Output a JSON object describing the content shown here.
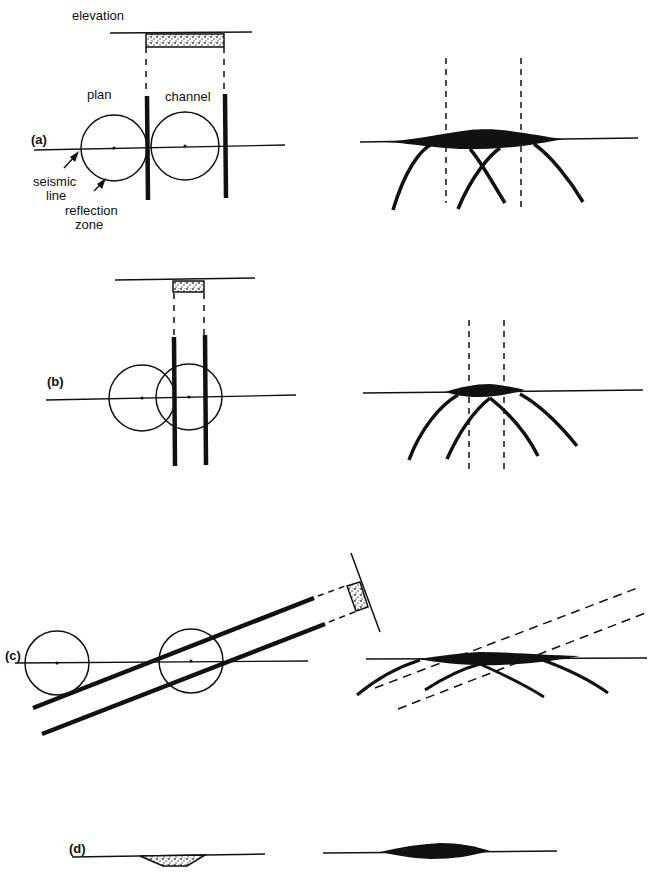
{
  "figure": {
    "panels": [
      {
        "id": "a",
        "label": "(a)"
      },
      {
        "id": "b",
        "label": "(b)"
      },
      {
        "id": "c",
        "label": "(c)"
      },
      {
        "id": "d",
        "label": "(d)"
      }
    ],
    "annotations": {
      "elevation": "elevation",
      "plan": "plan",
      "channel": "channel",
      "seismic_line_1": "seismic",
      "seismic_line_2": "line",
      "reflection_zone_1": "reflection",
      "reflection_zone_2": "zone"
    },
    "colors": {
      "ink": "#111111",
      "fill_pattern": "#555555",
      "background": "#ffffff"
    }
  }
}
